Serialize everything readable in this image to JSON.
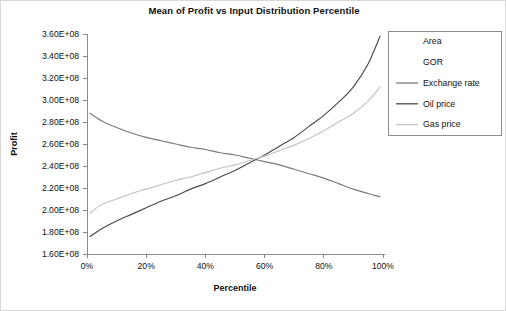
{
  "chart_data": {
    "type": "line",
    "title": "Mean of Profit vs Input Distribution Percentile",
    "xlabel": "Percentile",
    "ylabel": "Profit",
    "grid": false,
    "legend_position": "right",
    "xlim": [
      0,
      100
    ],
    "ylim": [
      160000000,
      360000000
    ],
    "x_tick_labels": [
      "0%",
      "20%",
      "40%",
      "60%",
      "80%",
      "100%"
    ],
    "x_tick_values": [
      0,
      20,
      40,
      60,
      80,
      100
    ],
    "y_tick_labels": [
      "3.60E+08",
      "3.40E+08",
      "3.20E+08",
      "3.00E+08",
      "2.80E+08",
      "2.60E+08",
      "2.40E+08",
      "2.20E+08",
      "2.00E+08",
      "1.80E+08",
      "1.60E+08"
    ],
    "y_tick_values": [
      360000000,
      340000000,
      320000000,
      300000000,
      280000000,
      260000000,
      240000000,
      220000000,
      200000000,
      180000000,
      160000000
    ],
    "x": [
      1,
      5,
      10,
      15,
      20,
      25,
      30,
      35,
      40,
      45,
      50,
      55,
      60,
      65,
      70,
      75,
      80,
      85,
      90,
      95,
      99
    ],
    "series": [
      {
        "name": "Area",
        "color": "#ffffff",
        "visible_line": false,
        "values": [
          245000000,
          245000000,
          245000000,
          245000000,
          245000000,
          245000000,
          245000000,
          245000000,
          245000000,
          245000000,
          245000000,
          245000000,
          245000000,
          245000000,
          245000000,
          245000000,
          245000000,
          245000000,
          245000000,
          245000000,
          245000000
        ]
      },
      {
        "name": "GOR",
        "color": "#fbfbfb",
        "visible_line": false,
        "values": [
          245000000,
          245000000,
          245000000,
          245000000,
          245000000,
          245000000,
          245000000,
          245000000,
          245000000,
          245000000,
          245000000,
          245000000,
          245000000,
          245000000,
          245000000,
          245000000,
          245000000,
          245000000,
          245000000,
          245000000,
          245000000
        ]
      },
      {
        "name": "Exchange rate",
        "color": "#7a7a7a",
        "visible_line": true,
        "values": [
          288000000,
          281000000,
          275000000,
          270000000,
          266000000,
          263000000,
          260000000,
          257000000,
          255000000,
          252000000,
          250000000,
          247000000,
          244000000,
          241000000,
          237000000,
          233000000,
          229000000,
          224000000,
          219000000,
          215000000,
          212000000
        ]
      },
      {
        "name": "Oil price",
        "color": "#4a4a4a",
        "visible_line": true,
        "values": [
          176000000,
          183000000,
          190000000,
          196000000,
          202000000,
          208000000,
          213000000,
          219000000,
          224000000,
          230000000,
          236000000,
          243000000,
          250000000,
          258000000,
          266000000,
          276000000,
          286000000,
          298000000,
          312000000,
          333000000,
          358000000
        ]
      },
      {
        "name": "Gas price",
        "color": "#c2c2c2",
        "visible_line": true,
        "values": [
          197000000,
          205000000,
          210000000,
          215000000,
          219000000,
          223000000,
          227000000,
          230000000,
          234000000,
          238000000,
          241000000,
          245000000,
          249000000,
          254000000,
          259000000,
          265000000,
          272000000,
          280000000,
          288000000,
          299000000,
          312000000
        ]
      }
    ],
    "annotations": []
  },
  "legend": {
    "entries": [
      {
        "label": "Area"
      },
      {
        "label": "GOR"
      },
      {
        "label": "Exchange rate"
      },
      {
        "label": "Oil price"
      },
      {
        "label": "Gas price"
      }
    ]
  }
}
